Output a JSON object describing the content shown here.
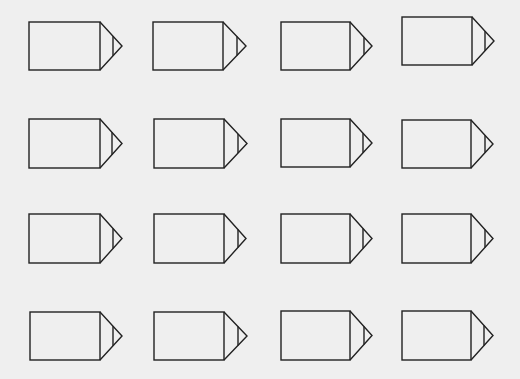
{
  "canvas": {
    "width": 520,
    "height": 379,
    "background": "#efefef",
    "stroke_color": "#222222"
  },
  "shape_type": "pencil-tag (rectangle with pointed tip)",
  "grid": {
    "rows": 4,
    "cols": 4
  },
  "shapes": [
    {
      "id": "r1c1",
      "left": 29,
      "top": 22,
      "right": 100,
      "bottom": 70,
      "tip_x": 122,
      "inner_x": 113
    },
    {
      "id": "r1c2",
      "left": 153,
      "top": 22,
      "right": 223,
      "bottom": 70,
      "tip_x": 246,
      "inner_x": 237
    },
    {
      "id": "r1c3",
      "left": 281,
      "top": 22,
      "right": 350,
      "bottom": 70,
      "tip_x": 372,
      "inner_x": 364
    },
    {
      "id": "r1c4",
      "left": 402,
      "top": 17,
      "right": 472,
      "bottom": 65,
      "tip_x": 494,
      "inner_x": 485
    },
    {
      "id": "r2c1",
      "left": 29,
      "top": 119,
      "right": 100,
      "bottom": 168,
      "tip_x": 122,
      "inner_x": 112
    },
    {
      "id": "r2c2",
      "left": 154,
      "top": 119,
      "right": 224,
      "bottom": 168,
      "tip_x": 247,
      "inner_x": 238
    },
    {
      "id": "r2c3",
      "left": 281,
      "top": 119,
      "right": 350,
      "bottom": 167,
      "tip_x": 372,
      "inner_x": 363
    },
    {
      "id": "r2c4",
      "left": 402,
      "top": 120,
      "right": 471,
      "bottom": 168,
      "tip_x": 493,
      "inner_x": 485
    },
    {
      "id": "r3c1",
      "left": 29,
      "top": 214,
      "right": 100,
      "bottom": 263,
      "tip_x": 122,
      "inner_x": 113
    },
    {
      "id": "r3c2",
      "left": 154,
      "top": 214,
      "right": 224,
      "bottom": 263,
      "tip_x": 246,
      "inner_x": 238
    },
    {
      "id": "r3c3",
      "left": 281,
      "top": 214,
      "right": 350,
      "bottom": 263,
      "tip_x": 372,
      "inner_x": 363
    },
    {
      "id": "r3c4",
      "left": 402,
      "top": 214,
      "right": 471,
      "bottom": 263,
      "tip_x": 493,
      "inner_x": 485
    },
    {
      "id": "r4c1",
      "left": 30,
      "top": 312,
      "right": 100,
      "bottom": 360,
      "tip_x": 122,
      "inner_x": 113
    },
    {
      "id": "r4c2",
      "left": 154,
      "top": 312,
      "right": 224,
      "bottom": 360,
      "tip_x": 247,
      "inner_x": 238
    },
    {
      "id": "r4c3",
      "left": 281,
      "top": 311,
      "right": 350,
      "bottom": 360,
      "tip_x": 372,
      "inner_x": 364
    },
    {
      "id": "r4c4",
      "left": 402,
      "top": 311,
      "right": 471,
      "bottom": 360,
      "tip_x": 493,
      "inner_x": 484
    }
  ]
}
